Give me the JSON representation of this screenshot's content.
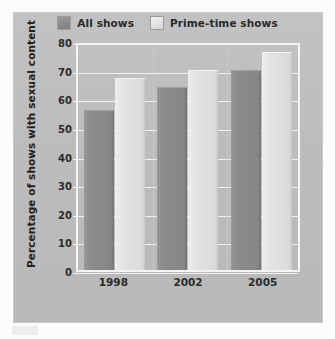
{
  "chart_data": {
    "type": "bar",
    "title": "",
    "xlabel": "",
    "ylabel": "Percentage of shows with sexual content",
    "categories": [
      "1998",
      "2002",
      "2005"
    ],
    "series": [
      {
        "name": "All shows",
        "values": [
          56,
          64,
          70
        ],
        "color": "#8b8b8b"
      },
      {
        "name": "Prime-time shows",
        "values": [
          67,
          70,
          76
        ],
        "color": "#e2e2e2"
      }
    ],
    "ylim": [
      0,
      80
    ],
    "ytick_step": 10,
    "yticks": [
      "80",
      "70",
      "60",
      "50",
      "40",
      "30",
      "20",
      "10",
      "0"
    ],
    "ytick_values": [
      80,
      70,
      60,
      50,
      40,
      30,
      20,
      10,
      0
    ],
    "grid": true,
    "legend_position": "top-center",
    "plot_background": "#bdbdbd",
    "gridline_color": "#f2f2f2",
    "axis_color": "#f4f4f4"
  },
  "legend": {
    "entries": [
      {
        "label": "All shows",
        "swatch": "dark"
      },
      {
        "label": "Prime-time shows",
        "swatch": "light"
      }
    ]
  }
}
